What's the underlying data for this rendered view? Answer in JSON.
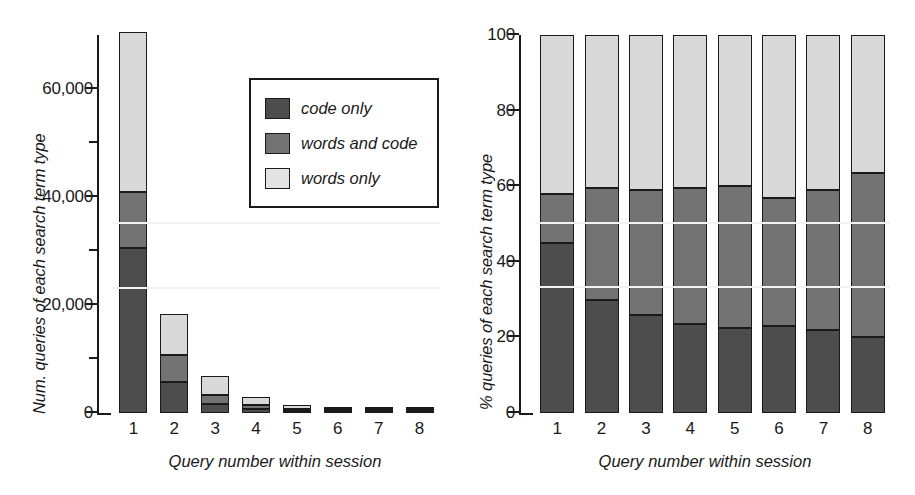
{
  "figure": {
    "background": "#ffffff",
    "series_colors": {
      "code_only": "#4d4d4d",
      "words_and_code": "#737373",
      "words_only": "#d9d9d9"
    }
  },
  "legend": {
    "items": [
      {
        "label": "code only",
        "color": "#4d4d4d",
        "swatch": "legend-swatch-code-only"
      },
      {
        "label": "words and code",
        "color": "#737373",
        "swatch": "legend-swatch-words-and-code"
      },
      {
        "label": "words only",
        "color": "#e3e3e3",
        "swatch": "legend-swatch-words-only"
      }
    ]
  },
  "chart_data": [
    {
      "id": "left",
      "type": "bar",
      "stacked": true,
      "title": "",
      "xlabel": "Query number within session",
      "ylabel": "Num. queries of each search term type",
      "categories": [
        "1",
        "2",
        "3",
        "4",
        "5",
        "6",
        "7",
        "8"
      ],
      "ylim": [
        0,
        70000
      ],
      "yticks": [
        0,
        10000,
        20000,
        30000,
        40000,
        50000,
        60000
      ],
      "ytick_labels": [
        "0",
        "",
        "20,000",
        "",
        "40,000",
        "",
        "60,000"
      ],
      "ytick_major": [
        0,
        20000,
        40000,
        60000
      ],
      "ytick_minor": [
        10000,
        30000,
        50000
      ],
      "gridlines": [
        23000,
        35000
      ],
      "grid": true,
      "legend_position": "inside-upper-center",
      "series": [
        {
          "name": "code only",
          "values": [
            30500,
            5700,
            1700,
            700,
            350,
            200,
            120,
            70
          ]
        },
        {
          "name": "words and code",
          "values": [
            10500,
            5000,
            1650,
            700,
            350,
            180,
            110,
            70
          ]
        },
        {
          "name": "words only",
          "values": [
            29500,
            7700,
            3550,
            1650,
            800,
            420,
            250,
            150
          ]
        }
      ]
    },
    {
      "id": "right",
      "type": "bar",
      "stacked": true,
      "normalized": true,
      "title": "",
      "xlabel": "Query number within session",
      "ylabel": "% queries of each search term type",
      "categories": [
        "1",
        "2",
        "3",
        "4",
        "5",
        "6",
        "7",
        "8"
      ],
      "ylim": [
        0,
        100
      ],
      "yticks": [
        0,
        20,
        40,
        60,
        80,
        100
      ],
      "ytick_labels": [
        "0",
        "20",
        "40",
        "60",
        "80",
        "100"
      ],
      "gridlines": [
        33,
        50
      ],
      "grid": true,
      "legend_position": "none",
      "series": [
        {
          "name": "code only",
          "values": [
            45,
            30,
            26,
            23.5,
            22.5,
            23,
            22,
            20
          ]
        },
        {
          "name": "words and code",
          "values": [
            13,
            29.5,
            33,
            36,
            37.5,
            34,
            37,
            43.5
          ]
        },
        {
          "name": "words only",
          "values": [
            42,
            40.5,
            41,
            40.5,
            40,
            43,
            41,
            36.5
          ]
        }
      ]
    }
  ]
}
